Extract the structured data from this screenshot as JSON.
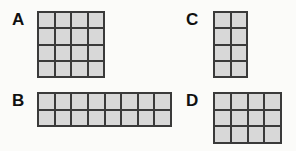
{
  "background_color": "#fbfbf9",
  "cell_fill_color": "#d8d8d8",
  "grid_line_color": "#3a3a3a",
  "label_color": "#101010",
  "figures": [
    {
      "label": "A",
      "columns": 4,
      "rows": 4,
      "cell_count": 16
    },
    {
      "label": "B",
      "columns": 8,
      "rows": 2,
      "cell_count": 16
    },
    {
      "label": "C",
      "columns": 2,
      "rows": 4,
      "cell_count": 8
    },
    {
      "label": "D",
      "columns": 4,
      "rows": 3,
      "cell_count": 12
    }
  ]
}
